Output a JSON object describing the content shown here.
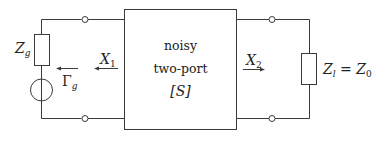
{
  "diagram": {
    "type": "circuit",
    "two_port": {
      "line1": "noisy",
      "line2": "two-port",
      "line3": "[S]"
    },
    "source": {
      "impedance_label": "Z",
      "impedance_sub": "g",
      "reflection_label": "Γ",
      "reflection_sub": "g"
    },
    "port1_wave": {
      "label": "X",
      "sub": "1"
    },
    "port2_wave": {
      "label": "X",
      "sub": "2"
    },
    "load": {
      "label": "Z",
      "sub": "l",
      "eq": " = ",
      "rhs": "Z",
      "rhs_sub": "0"
    },
    "colors": {
      "line": "#3a3a3a",
      "text": "#222222",
      "background": "#ffffff"
    }
  }
}
